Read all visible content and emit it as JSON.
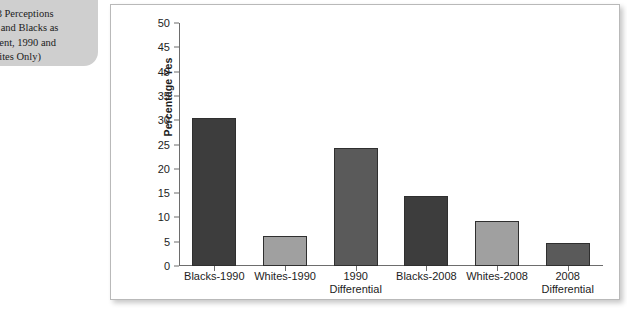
{
  "caption": {
    "text": ".3 Perceptions\ns and Blacks as\ngent, 1990 and\nhites Only)"
  },
  "chart_data": {
    "type": "bar",
    "title": "",
    "xlabel": "",
    "ylabel": "Percentage Yes",
    "ylim": [
      0,
      50
    ],
    "ytick_step": 5,
    "yticks": [
      50,
      45,
      40,
      35,
      30,
      25,
      20,
      15,
      10,
      5,
      0
    ],
    "grid": false,
    "legend": "none",
    "categories": [
      "Blacks-1990",
      "Whites-1990",
      "1990\nDifferential",
      "Blacks-2008",
      "Whites-2008",
      "2008\nDifferential"
    ],
    "values": [
      30.5,
      6.2,
      24.3,
      14.4,
      9.3,
      4.8
    ],
    "bar_colors": [
      "#3d3d3d",
      "#a0a0a0",
      "#5a5a5a",
      "#3d3d3d",
      "#a0a0a0",
      "#5a5a5a"
    ],
    "bar_edge_color": "#2f2f2f"
  },
  "colors": {
    "caption_background": "#cfcfcf",
    "panel_background": "#ffffff",
    "panel_border": "#b9b9b9",
    "axis": "#6d6d6d",
    "text": "#1d1d1d"
  }
}
